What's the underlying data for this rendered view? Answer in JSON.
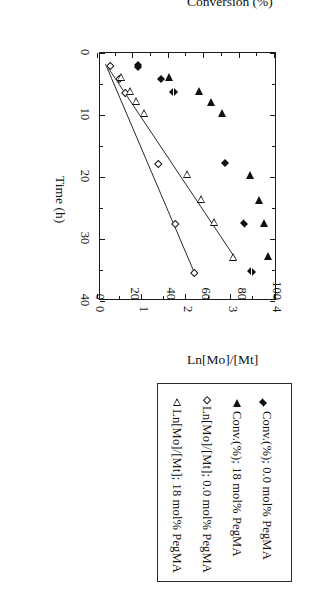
{
  "chart_data": {
    "type": "scatter",
    "title": "",
    "xlabel": "Time (h)",
    "ylabel": "Conversion (%)",
    "y2label": "Ln[Mo]/[Mt]",
    "xlim": [
      0,
      40
    ],
    "ylim": [
      0,
      100
    ],
    "y2lim": [
      0,
      4
    ],
    "xticks": [
      "0",
      "10",
      "20",
      "30",
      "40"
    ],
    "yticks": [
      "0",
      "20",
      "40",
      "60",
      "80",
      "100"
    ],
    "y2ticks": [
      "0",
      "1",
      "2",
      "3",
      "4"
    ],
    "grid": false,
    "legend_position": "right-outside",
    "rotation_deg": 90,
    "series": [
      {
        "name": "Conv.(%); 0.0 mol% PegMA",
        "marker": "filled-diamond",
        "axis": "left",
        "points": [
          {
            "x": 2.0,
            "y": 25
          },
          {
            "x": 2.3,
            "y": 25
          },
          {
            "x": 4.2,
            "y": 38
          },
          {
            "x": 6.3,
            "y": 45
          },
          {
            "x": 17.8,
            "y": 74
          },
          {
            "x": 27.5,
            "y": 85
          },
          {
            "x": 35.3,
            "y": 89
          }
        ]
      },
      {
        "name": "Conv.(%); 18 mol% PegMA",
        "marker": "filled-triangle",
        "axis": "left",
        "points": [
          {
            "x": 3.8,
            "y": 40
          },
          {
            "x": 6.2,
            "y": 57
          },
          {
            "x": 7.9,
            "y": 64
          },
          {
            "x": 9.7,
            "y": 70
          },
          {
            "x": 19.7,
            "y": 86
          },
          {
            "x": 23.7,
            "y": 91
          },
          {
            "x": 27.4,
            "y": 94
          },
          {
            "x": 32.8,
            "y": 96
          }
        ]
      },
      {
        "name": "Ln[Mo]/[Mt]; 0.0 mol% PegMA",
        "marker": "open-diamond",
        "axis": "right",
        "points": [
          {
            "x": 2.1,
            "y": 0.28
          },
          {
            "x": 4.2,
            "y": 0.48
          },
          {
            "x": 6.4,
            "y": 0.6
          },
          {
            "x": 17.9,
            "y": 1.35
          },
          {
            "x": 27.6,
            "y": 1.73
          },
          {
            "x": 35.5,
            "y": 2.17
          }
        ]
      },
      {
        "name": "Ln[Mo]/[Mt]; 18 mol% PegMA",
        "marker": "open-triangle",
        "axis": "right",
        "points": [
          {
            "x": 3.9,
            "y": 0.52
          },
          {
            "x": 6.1,
            "y": 0.72
          },
          {
            "x": 7.8,
            "y": 0.86
          },
          {
            "x": 9.7,
            "y": 1.05
          },
          {
            "x": 19.5,
            "y": 2.02
          },
          {
            "x": 23.6,
            "y": 2.33
          },
          {
            "x": 27.3,
            "y": 2.62
          },
          {
            "x": 32.9,
            "y": 3.05
          }
        ]
      }
    ],
    "fit_lines": [
      {
        "series": "Ln[Mo]/[Mt]; 0.0 mol% PegMA",
        "x0": 1.8,
        "y0": 0.17,
        "x1": 35.8,
        "y1": 2.2
      },
      {
        "series": "Ln[Mo]/[Mt]; 18 mol% PegMA",
        "x0": 2.3,
        "y0": 0.22,
        "x1": 33.4,
        "y1": 3.13
      }
    ]
  },
  "axes": {
    "x_title": "Time (h)",
    "y_left_title": "Conversion (%)",
    "y_right_title": "Ln[Mo]/[Mt]",
    "x_ticks": [
      "0",
      "10",
      "20",
      "30",
      "40"
    ],
    "y_left_ticks": [
      "100",
      "80",
      "60",
      "40",
      "20",
      "0"
    ],
    "y_right_ticks": [
      "4",
      "3",
      "2",
      "1",
      "0"
    ]
  },
  "legend": {
    "items": [
      {
        "marker": "filled-diamond",
        "label": "Conv.(%); 0.0 mol% PegMA"
      },
      {
        "marker": "filled-triangle",
        "label": "Conv.(%); 18 mol% PegMA"
      },
      {
        "marker": "open-diamond",
        "label": "Ln[Mo]/[Mt]; 0.0 mol% PegMA"
      },
      {
        "marker": "open-triangle",
        "label": "Ln[Mo]/[Mt]; 18 mol% PegMA"
      }
    ]
  },
  "colors": {
    "ink": "#111111",
    "frame": "#1a1a1a",
    "background": "#ffffff"
  }
}
